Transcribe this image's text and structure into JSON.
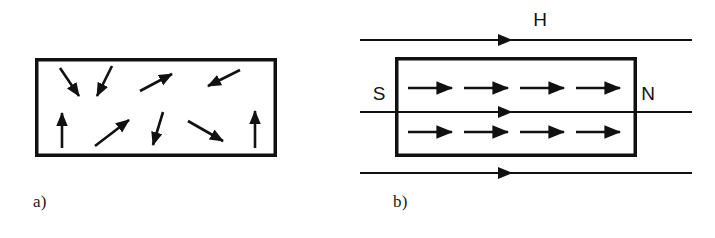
{
  "figure": {
    "background_color": "#ffffff",
    "ink_color": "#111111",
    "caption_font_color": "#1a1a1a"
  },
  "panels": [
    {
      "id": "a",
      "label": "a)",
      "description": "unmagnetized ferromagnet with randomly oriented domains",
      "box": {
        "x": 35,
        "y": 58,
        "width": 242,
        "height": 99,
        "stroke_width": 3.5
      },
      "arrow_count": 9,
      "arrows": [
        {
          "name": "domain-arrow-1",
          "x1": 60,
          "y1": 68,
          "x2": 81,
          "y2": 99,
          "direction": "down-right"
        },
        {
          "name": "domain-arrow-2",
          "x1": 112,
          "y1": 66,
          "x2": 96,
          "y2": 99,
          "direction": "down-left"
        },
        {
          "name": "domain-arrow-3",
          "x1": 140,
          "y1": 91,
          "x2": 175,
          "y2": 72,
          "direction": "up-right"
        },
        {
          "name": "domain-arrow-4",
          "x1": 240,
          "y1": 70,
          "x2": 205,
          "y2": 87,
          "direction": "up-left"
        },
        {
          "name": "domain-arrow-5",
          "x1": 62,
          "y1": 148,
          "x2": 62,
          "y2": 110,
          "direction": "up"
        },
        {
          "name": "domain-arrow-6",
          "x1": 95,
          "y1": 146,
          "x2": 132,
          "y2": 118,
          "direction": "up-right"
        },
        {
          "name": "domain-arrow-7",
          "x1": 163,
          "y1": 112,
          "x2": 152,
          "y2": 148,
          "direction": "down-left"
        },
        {
          "name": "domain-arrow-8",
          "x1": 188,
          "y1": 121,
          "x2": 226,
          "y2": 143,
          "direction": "down-right"
        },
        {
          "name": "domain-arrow-9",
          "x1": 255,
          "y1": 148,
          "x2": 255,
          "y2": 108,
          "direction": "up"
        }
      ]
    },
    {
      "id": "b",
      "label": "b)",
      "description": "magnetized ferromagnet in external field H with aligned domains",
      "box": {
        "x": 395,
        "y": 57,
        "width": 241,
        "height": 100,
        "stroke_width": 3.5
      },
      "field_label": "H",
      "pole_left_label": "S",
      "pole_right_label": "N",
      "field_lines": [
        {
          "name": "field-line-top",
          "y": 40,
          "x1": 360,
          "x2": 692,
          "arrow_x": 512
        },
        {
          "name": "field-line-middle",
          "y": 112,
          "x1": 360,
          "x2": 692,
          "arrow_x": 512
        },
        {
          "name": "field-line-bottom",
          "y": 173,
          "x1": 360,
          "x2": 692,
          "arrow_x": 512
        }
      ],
      "domain_rows": [
        {
          "name": "aligned-row-top",
          "y": 88,
          "arrow_x_starts": [
            408,
            464,
            520,
            576
          ],
          "arrow_length": 46,
          "count": 4
        },
        {
          "name": "aligned-row-bottom",
          "y": 132,
          "arrow_x_starts": [
            408,
            464,
            520,
            576
          ],
          "arrow_length": 46,
          "count": 4
        }
      ]
    }
  ]
}
